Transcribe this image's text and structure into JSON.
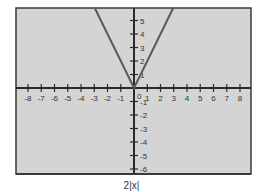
{
  "chart_data": {
    "type": "line",
    "title": "",
    "caption": "2|x|",
    "xlabel": "",
    "ylabel": "",
    "function": "y = 2|x|",
    "xlim": [
      -8.9,
      8.7
    ],
    "ylim": [
      -6.3,
      5.9
    ],
    "x_ticks": [
      -8,
      -7,
      -6,
      -5,
      -4,
      -3,
      -2,
      -1,
      1,
      2,
      3,
      4,
      5,
      6,
      7,
      8
    ],
    "y_ticks": [
      -6,
      -5,
      -4,
      -3,
      -2,
      -1,
      1,
      2,
      3,
      4,
      5
    ],
    "origin_label": "0",
    "grid": false,
    "series": [
      {
        "name": "2|x|",
        "x": [
          -2.95,
          -2,
          -1,
          0,
          1,
          2,
          2.95
        ],
        "y": [
          5.9,
          4,
          2,
          0,
          2,
          4,
          5.9
        ]
      }
    ],
    "colors": {
      "background": "#d4d4d4",
      "frame": "#3a3a3a",
      "axes": "#2a2a2a",
      "line": "#5a5a5a",
      "text": "#333333"
    }
  }
}
